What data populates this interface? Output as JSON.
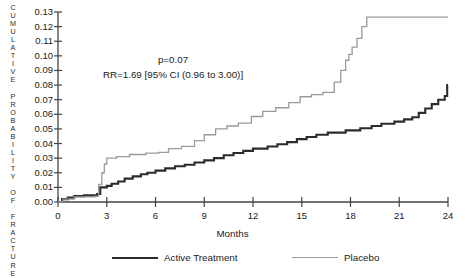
{
  "chart_data": {
    "type": "line",
    "subtype": "step",
    "title": "",
    "xlabel": "Months",
    "ylabel": "CUMULATIVE PROBABILITY OF FRACTURE",
    "xlim": [
      0,
      24
    ],
    "ylim": [
      0.0,
      0.13
    ],
    "xticks": [
      0,
      3,
      6,
      9,
      12,
      15,
      18,
      21,
      24
    ],
    "yticks": [
      "0.00",
      "0.01",
      "0.02",
      "0.03",
      "0.04",
      "0.05",
      "0.06",
      "0.07",
      "0.08",
      "0.09",
      "0.10",
      "0.11",
      "0.12",
      "0.13"
    ],
    "grid": false,
    "legend_position": "bottom",
    "annotations": [
      "p=0.07",
      "RR=1.69 [95% CI (0.96 to 3.00)]"
    ],
    "series": [
      {
        "name": "Active Treatment",
        "color": "#2b2b2b",
        "linewidth": 2.1,
        "points": [
          [
            0.0,
            0.0
          ],
          [
            0.25,
            0.002
          ],
          [
            0.6,
            0.003
          ],
          [
            1.0,
            0.004
          ],
          [
            1.6,
            0.0045
          ],
          [
            2.4,
            0.0055
          ],
          [
            2.6,
            0.01
          ],
          [
            3.0,
            0.011
          ],
          [
            3.3,
            0.0125
          ],
          [
            3.7,
            0.014
          ],
          [
            4.1,
            0.016
          ],
          [
            4.6,
            0.0175
          ],
          [
            5.1,
            0.019
          ],
          [
            5.5,
            0.02
          ],
          [
            6.0,
            0.0215
          ],
          [
            6.6,
            0.023
          ],
          [
            7.2,
            0.0245
          ],
          [
            7.8,
            0.0255
          ],
          [
            8.4,
            0.027
          ],
          [
            9.0,
            0.0285
          ],
          [
            9.6,
            0.03
          ],
          [
            10.2,
            0.032
          ],
          [
            10.8,
            0.0335
          ],
          [
            11.4,
            0.035
          ],
          [
            12.0,
            0.0365
          ],
          [
            12.9,
            0.038
          ],
          [
            13.5,
            0.0395
          ],
          [
            14.1,
            0.041
          ],
          [
            14.7,
            0.043
          ],
          [
            15.3,
            0.0445
          ],
          [
            15.9,
            0.046
          ],
          [
            16.6,
            0.0475
          ],
          [
            17.7,
            0.049
          ],
          [
            18.6,
            0.0505
          ],
          [
            19.3,
            0.052
          ],
          [
            19.9,
            0.0535
          ],
          [
            20.7,
            0.055
          ],
          [
            21.3,
            0.0565
          ],
          [
            21.8,
            0.058
          ],
          [
            22.2,
            0.061
          ],
          [
            22.6,
            0.064
          ],
          [
            23.0,
            0.067
          ],
          [
            23.4,
            0.07
          ],
          [
            23.8,
            0.0725
          ],
          [
            23.95,
            0.08
          ],
          [
            24.0,
            0.08
          ]
        ]
      },
      {
        "name": "Placebo",
        "color": "#9a9a9a",
        "linewidth": 1.3,
        "points": [
          [
            0.0,
            0.0
          ],
          [
            0.3,
            0.002
          ],
          [
            1.0,
            0.0035
          ],
          [
            2.3,
            0.004
          ],
          [
            2.5,
            0.012
          ],
          [
            2.7,
            0.02
          ],
          [
            2.85,
            0.026
          ],
          [
            3.0,
            0.03
          ],
          [
            3.6,
            0.031
          ],
          [
            4.4,
            0.0325
          ],
          [
            5.4,
            0.0335
          ],
          [
            6.2,
            0.034
          ],
          [
            6.8,
            0.0365
          ],
          [
            7.6,
            0.038
          ],
          [
            8.4,
            0.042
          ],
          [
            9.0,
            0.046
          ],
          [
            9.7,
            0.05
          ],
          [
            10.4,
            0.052
          ],
          [
            11.1,
            0.054
          ],
          [
            11.9,
            0.0585
          ],
          [
            12.6,
            0.062
          ],
          [
            13.4,
            0.0645
          ],
          [
            14.2,
            0.068
          ],
          [
            14.9,
            0.072
          ],
          [
            15.6,
            0.0735
          ],
          [
            16.3,
            0.075
          ],
          [
            17.0,
            0.082
          ],
          [
            17.4,
            0.09
          ],
          [
            17.7,
            0.097
          ],
          [
            17.9,
            0.101
          ],
          [
            18.1,
            0.106
          ],
          [
            18.4,
            0.112
          ],
          [
            18.7,
            0.12
          ],
          [
            19.0,
            0.1265
          ],
          [
            24.0,
            0.1265
          ]
        ]
      }
    ]
  },
  "axis": {
    "ylabel_chars": "C\nU\nM\nU\nL\nA\nT\nI\nV\nE\n \nP\nR\nO\nB\nA\nB\nI\nL\nI\nT\nY\n \nO\nF\n \nF\nR\nA\nC\nT\nU\nR\nE",
    "xlabel": "Months",
    "yticks": [
      "0.13",
      "0.12",
      "0.11",
      "0.10",
      "0.09",
      "0.08",
      "0.07",
      "0.06",
      "0.05",
      "0.04",
      "0.03",
      "0.02",
      "0.01",
      "0.00"
    ],
    "xticks": [
      "0",
      "3",
      "6",
      "9",
      "12",
      "15",
      "18",
      "21",
      "24"
    ]
  },
  "annotations": {
    "pvalue": "p=0.07",
    "risk_ratio": "RR=1.69 [95% CI (0.96 to 3.00)]"
  },
  "legend": {
    "items": [
      {
        "label": "Active Treatment",
        "color": "#2b2b2b"
      },
      {
        "label": "Placebo",
        "color": "#9a9a9a"
      }
    ]
  }
}
